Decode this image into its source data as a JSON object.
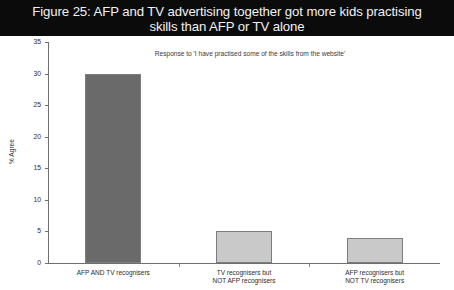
{
  "title": {
    "line1": "Figure 25: AFP and TV advertising together got more kids practising",
    "line2": "skills than AFP or TV alone"
  },
  "chart_data": {
    "type": "bar",
    "title": "Figure 25: AFP and TV advertising together got more kids practising skills than AFP or TV alone",
    "subtitle": "Response to 'I have practised some of the skills from the website'",
    "categories": [
      "AFP AND TV recognisers",
      "TV recognisers but NOT AFP recognisers",
      "AFP recognisers but NOT TV recognisers"
    ],
    "category_lines": [
      [
        "AFP AND TV recognisers"
      ],
      [
        "TV recognisers but",
        "NOT AFP recognisers"
      ],
      [
        "AFP recognisers but",
        "NOT TV recognisers"
      ]
    ],
    "values": [
      30,
      5,
      4
    ],
    "xlabel": "",
    "ylabel": "% Agree",
    "ylim": [
      0,
      35
    ],
    "yticks": [
      0,
      5,
      10,
      15,
      20,
      25,
      30,
      35
    ],
    "ytick_labels": [
      "0",
      "5",
      "10",
      "15",
      "20",
      "25",
      "30",
      "35"
    ],
    "grid": false,
    "legend": "none",
    "bar_colors": [
      "#6a6a6a",
      "#c9c9c9",
      "#c9c9c9"
    ],
    "bar_border_color": "#7d7d7d",
    "axis_color": "#6f6f6f",
    "background": "#ffffff",
    "title_background": "#0b0b0b",
    "title_color": "#f2f2f2"
  }
}
